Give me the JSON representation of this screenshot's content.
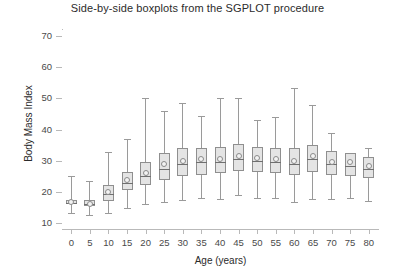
{
  "chart_data": {
    "type": "box",
    "title": "Side-by-side boxplots from the SGPLOT procedure",
    "xlabel": "Age (years)",
    "ylabel": "Body Mass Index",
    "xlim": [
      -2.5,
      82.5
    ],
    "ylim": [
      8,
      72
    ],
    "ytick_values": [
      10,
      20,
      30,
      40,
      50,
      60,
      70
    ],
    "ytick_labels": [
      "10",
      "20",
      "30",
      "40",
      "50",
      "60",
      "70"
    ],
    "xtick_values": [
      0,
      5,
      10,
      15,
      20,
      25,
      30,
      35,
      40,
      45,
      50,
      55,
      60,
      65,
      70,
      75,
      80
    ],
    "xtick_labels": [
      "0",
      "5",
      "10",
      "15",
      "20",
      "25",
      "30",
      "35",
      "40",
      "45",
      "50",
      "55",
      "60",
      "65",
      "70",
      "75",
      "80"
    ],
    "grid": false,
    "legend": "none",
    "categories": [
      "0",
      "5",
      "10",
      "15",
      "20",
      "25",
      "30",
      "35",
      "40",
      "45",
      "50",
      "55",
      "60",
      "65",
      "70",
      "75",
      "80"
    ],
    "show_mean_marker": true,
    "mean_marker_shape": "circle",
    "boxes": [
      {
        "category": "0",
        "min": 13.0,
        "q1": 15.9,
        "median": 16.5,
        "mean": 16.6,
        "q3": 17.4,
        "max": 25.0
      },
      {
        "category": "5",
        "min": 12.6,
        "q1": 15.3,
        "median": 15.9,
        "mean": 16.2,
        "q3": 17.2,
        "max": 23.4
      },
      {
        "category": "10",
        "min": 13.1,
        "q1": 17.0,
        "median": 19.3,
        "mean": 20.0,
        "q3": 22.0,
        "max": 32.8
      },
      {
        "category": "15",
        "min": 14.6,
        "q1": 20.4,
        "median": 22.9,
        "mean": 23.8,
        "q3": 26.4,
        "max": 36.9
      },
      {
        "category": "20",
        "min": 16.0,
        "q1": 22.1,
        "median": 25.0,
        "mean": 26.1,
        "q3": 29.4,
        "max": 50.0
      },
      {
        "category": "25",
        "min": 16.6,
        "q1": 23.9,
        "median": 27.4,
        "mean": 28.9,
        "q3": 32.4,
        "max": 46.0
      },
      {
        "category": "30",
        "min": 17.4,
        "q1": 25.0,
        "median": 28.9,
        "mean": 30.0,
        "q3": 34.0,
        "max": 48.4
      },
      {
        "category": "35",
        "min": 18.0,
        "q1": 25.4,
        "median": 29.4,
        "mean": 30.4,
        "q3": 34.0,
        "max": 44.5
      },
      {
        "category": "40",
        "min": 17.5,
        "q1": 25.9,
        "median": 29.4,
        "mean": 30.5,
        "q3": 34.4,
        "max": 50.2
      },
      {
        "category": "45",
        "min": 19.0,
        "q1": 26.5,
        "median": 30.4,
        "mean": 31.4,
        "q3": 35.4,
        "max": 50.0
      },
      {
        "category": "50",
        "min": 18.0,
        "q1": 26.4,
        "median": 29.9,
        "mean": 30.8,
        "q3": 34.4,
        "max": 43.1
      },
      {
        "category": "55",
        "min": 18.0,
        "q1": 26.0,
        "median": 29.4,
        "mean": 30.4,
        "q3": 34.0,
        "max": 44.0
      },
      {
        "category": "60",
        "min": 16.6,
        "q1": 25.4,
        "median": 28.9,
        "mean": 30.0,
        "q3": 34.0,
        "max": 53.4
      },
      {
        "category": "65",
        "min": 17.5,
        "q1": 26.4,
        "median": 30.4,
        "mean": 31.4,
        "q3": 35.0,
        "max": 48.0
      },
      {
        "category": "70",
        "min": 17.5,
        "q1": 25.4,
        "median": 28.9,
        "mean": 29.5,
        "q3": 33.0,
        "max": 39.0
      },
      {
        "category": "75",
        "min": 18.0,
        "q1": 25.0,
        "median": 28.4,
        "mean": 29.4,
        "q3": 32.4,
        "max": 32.4
      },
      {
        "category": "80",
        "min": 17.0,
        "q1": 24.5,
        "median": 27.4,
        "mean": 28.4,
        "q3": 31.0,
        "max": 34.0
      }
    ],
    "colors": {
      "box_fill": "#e4e4e4",
      "box_border": "#8f8f8f",
      "whisker": "#9a9a9a",
      "median": "#6f6f6f",
      "mean_marker_fill": "#f3f3f3",
      "axis": "#b9b9b9",
      "text": "#2b2b2b",
      "background": "#ffffff"
    }
  }
}
